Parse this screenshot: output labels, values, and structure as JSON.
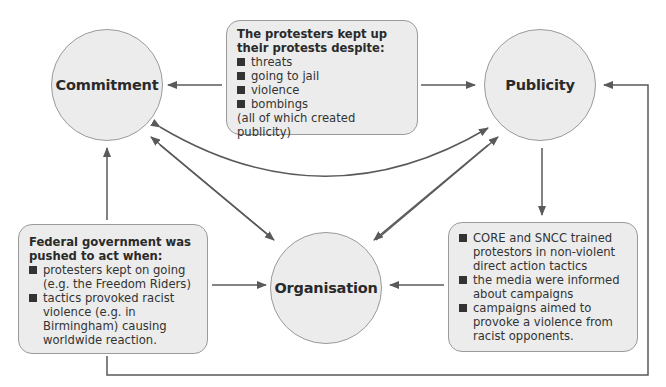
{
  "nodes": {
    "commitment": {
      "label": "Commitment"
    },
    "publicity": {
      "label": "Publicity"
    },
    "organisation": {
      "label": "Organisation"
    }
  },
  "boxes": {
    "top": {
      "title": "The protesters kept up their protests despite:",
      "items": [
        "threats",
        "going to jail",
        "violence",
        "bombings"
      ],
      "note": "(all of which created publicity)"
    },
    "bottom_left": {
      "title": "Federal government was pushed to act when:",
      "items": [
        "protesters kept on going (e.g. the Freedom Riders)",
        "tactics provoked racist violence (e.g. in Birmingham) causing worldwide reaction."
      ]
    },
    "bottom_right": {
      "items": [
        "CORE and SNCC trained protestors in non-violent direct action tactics",
        "the media were informed about campaigns",
        "campaigns aimed to provoke a violence from racist opponents."
      ]
    }
  },
  "colors": {
    "node_fill": "#ececec",
    "stroke": "#9a9a9a",
    "arrow": "#5a5a5a"
  },
  "edges": [
    {
      "from": "top_box",
      "to": "commitment"
    },
    {
      "from": "top_box",
      "to": "publicity"
    },
    {
      "from": "commitment",
      "to": "publicity",
      "bidirectional": true
    },
    {
      "from": "organisation",
      "to": "commitment"
    },
    {
      "from": "organisation",
      "to": "publicity"
    },
    {
      "from": "publicity",
      "to": "organisation"
    },
    {
      "from": "publicity",
      "to": "bottom_right_box"
    },
    {
      "from": "bottom_left_box",
      "to": "commitment"
    },
    {
      "from": "bottom_left_box",
      "to": "organisation"
    },
    {
      "from": "bottom_right_box",
      "to": "organisation"
    },
    {
      "from": "bottom_left_box",
      "to": "publicity",
      "routing": "bottom-loop"
    }
  ]
}
